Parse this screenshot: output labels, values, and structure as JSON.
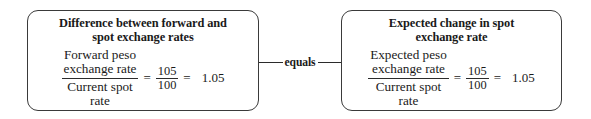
{
  "diagram": {
    "connector": {
      "label": "equals",
      "line_color": "#2b2b2b"
    },
    "boxes": [
      {
        "id": "difference-box",
        "title_line1": "Difference between forward and",
        "title_line2": "spot exchange rates",
        "equation": {
          "word_fraction": {
            "numerator_line1": "Forward peso",
            "numerator_line2": "exchange rate",
            "denominator_line1": "Current spot",
            "denominator_line2": "rate"
          },
          "equals_sign_1": "=",
          "numeric_fraction": {
            "numerator": "105",
            "denominator": "100"
          },
          "equals_sign_2": "=",
          "result": "1.05"
        }
      },
      {
        "id": "expected-change-box",
        "title_line1": "Expected change in spot",
        "title_line2": "exchange rate",
        "equation": {
          "word_fraction": {
            "numerator_line1": "Expected peso",
            "numerator_line2": "exchange rate",
            "denominator_line1": "Current spot",
            "denominator_line2": "rate"
          },
          "equals_sign_1": "=",
          "numeric_fraction": {
            "numerator": "105",
            "denominator": "100"
          },
          "equals_sign_2": "=",
          "result": "1.05"
        }
      }
    ]
  },
  "colors": {
    "background": "#ffffff",
    "box_border": "#3a3a3a",
    "text": "#1a1a1a",
    "rule": "#2b2b2b"
  }
}
